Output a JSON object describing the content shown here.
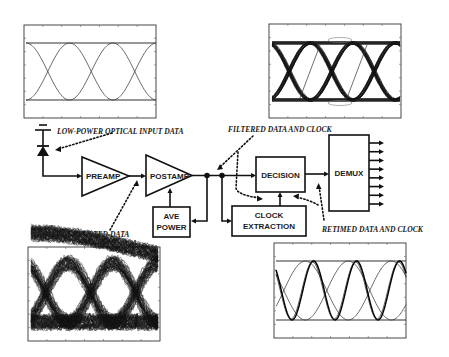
{
  "diagram": {
    "blocks": {
      "preamp": "PREAMP",
      "postamp": "POSTAMP",
      "ave_power_line1": "AVE",
      "ave_power_line2": "POWER",
      "decision": "DECISION",
      "clock_line1": "CLOCK",
      "clock_line2": "EXTRACTION",
      "demux": "DEMUX"
    },
    "annotations": {
      "input": "LOW-POWER OPTICAL INPUT DATA",
      "noise": "NOISE CORRUPTED DATA",
      "filtered": "FILTERED DATA AND CLOCK",
      "retimed": "RETIMED DATA AND CLOCK"
    },
    "demux_outputs": 8,
    "eye_diagrams": [
      {
        "id": "input-eye",
        "description": "clean low-power input eye"
      },
      {
        "id": "filtered-eye",
        "description": "filtered data and clock eye"
      },
      {
        "id": "noise-eye",
        "description": "noise corrupted eye"
      },
      {
        "id": "retimed-eye",
        "description": "retimed data and clock eye"
      }
    ]
  }
}
